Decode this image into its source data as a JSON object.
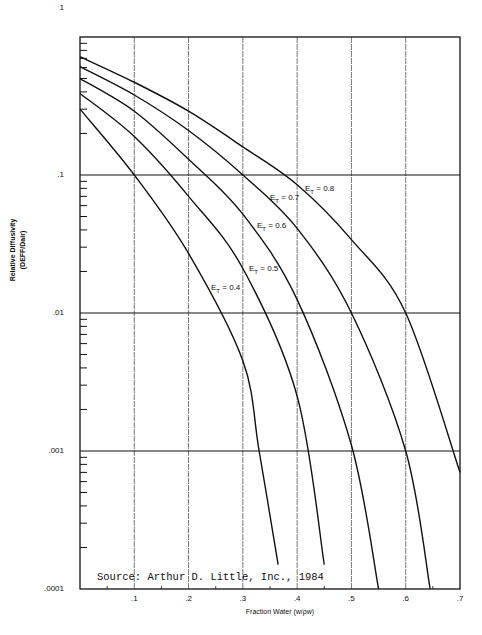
{
  "chart_data": {
    "type": "line",
    "title": "",
    "xlabel": "Fraction Water (w/ρw)",
    "ylabel": "Relative Diffusivity (DEFF/Dair)",
    "ylabel_line1": "Relative Diffusivity",
    "ylabel_line2": "(DEFF/Dair)",
    "yscale": "log",
    "xlim": [
      0,
      0.7
    ],
    "ylim": [
      0.0001,
      1
    ],
    "x_ticks": [
      ".1",
      ".2",
      ".3",
      ".4",
      ".5",
      ".6",
      ".7"
    ],
    "y_ticks": [
      "1",
      ".1",
      ".01",
      ".001",
      ".0001"
    ],
    "grid": true,
    "annotation": "Source: Arthur D. Little, Inc., 1984",
    "series": [
      {
        "name": "E_T = 0.8",
        "label": "0.8",
        "x": [
          0,
          0.1,
          0.2,
          0.3,
          0.4,
          0.5,
          0.6,
          0.7
        ],
        "y": [
          0.72,
          0.47,
          0.29,
          0.16,
          0.085,
          0.034,
          0.01,
          0.0007
        ]
      },
      {
        "name": "E_T = 0.7",
        "label": "0.7",
        "x": [
          0,
          0.1,
          0.2,
          0.3,
          0.4,
          0.5,
          0.6,
          0.645
        ],
        "y": [
          0.61,
          0.38,
          0.21,
          0.1,
          0.041,
          0.01,
          0.001,
          0.0001
        ]
      },
      {
        "name": "E_T = 0.6",
        "label": "0.6",
        "x": [
          0,
          0.1,
          0.2,
          0.3,
          0.4,
          0.5,
          0.55
        ],
        "y": [
          0.5,
          0.29,
          0.13,
          0.052,
          0.0125,
          0.0011,
          0.0001
        ]
      },
      {
        "name": "E_T = 0.5",
        "label": "0.5",
        "x": [
          0,
          0.1,
          0.2,
          0.3,
          0.4,
          0.45
        ],
        "y": [
          0.39,
          0.19,
          0.07,
          0.021,
          0.0025,
          0.00015
        ]
      },
      {
        "name": "E_T = 0.4",
        "label": "0.4",
        "x": [
          0,
          0.1,
          0.2,
          0.3,
          0.33,
          0.365
        ],
        "y": [
          0.3,
          0.1,
          0.027,
          0.0045,
          0.001,
          0.00015
        ]
      }
    ]
  }
}
